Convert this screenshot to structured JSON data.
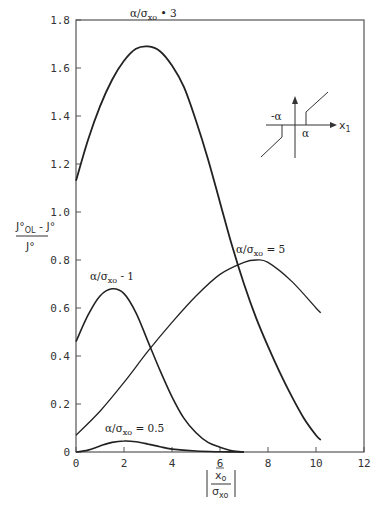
{
  "chart_data": {
    "type": "line",
    "title": "",
    "xlabel": "|x̄o / σxo|",
    "ylabel": "(J°OL − J°) / J°",
    "xlim": [
      0,
      12
    ],
    "ylim": [
      0,
      1.8
    ],
    "grid": false,
    "legend_position": "inline labels",
    "x_ticks": [
      "0",
      "2",
      "4",
      "6",
      "8",
      "10",
      "12"
    ],
    "y_ticks": [
      "0",
      "0.2",
      "0.4",
      "0.6",
      "0.8",
      "1.0",
      "1.2",
      "1.4",
      "1.6",
      "1.8"
    ],
    "series": [
      {
        "name": "α/σxo = 3",
        "x": [
          0,
          0.5,
          1,
          1.5,
          2,
          2.5,
          3,
          3.5,
          4,
          4.5,
          5,
          5.5,
          6,
          6.5,
          7,
          7.5,
          8,
          8.5,
          9,
          9.5,
          10,
          10.2
        ],
        "values": [
          1.13,
          1.3,
          1.44,
          1.55,
          1.63,
          1.68,
          1.69,
          1.67,
          1.61,
          1.52,
          1.38,
          1.22,
          1.04,
          0.86,
          0.7,
          0.56,
          0.44,
          0.33,
          0.23,
          0.14,
          0.07,
          0.05
        ]
      },
      {
        "name": "α/σxo = 5",
        "x": [
          0,
          1,
          2,
          3,
          4,
          5,
          6,
          7,
          7.5,
          8,
          9,
          10,
          10.2
        ],
        "values": [
          0.07,
          0.17,
          0.29,
          0.42,
          0.54,
          0.65,
          0.74,
          0.79,
          0.8,
          0.79,
          0.71,
          0.6,
          0.58
        ]
      },
      {
        "name": "α/σxo = 1",
        "x": [
          0,
          0.5,
          1,
          1.5,
          2,
          2.5,
          3,
          3.5,
          4,
          4.5,
          5,
          5.5,
          6,
          6.5,
          7
        ],
        "values": [
          0.46,
          0.57,
          0.65,
          0.68,
          0.66,
          0.58,
          0.46,
          0.34,
          0.23,
          0.14,
          0.08,
          0.04,
          0.02,
          0.005,
          0
        ]
      },
      {
        "name": "α/σxo = 0.5",
        "x": [
          0,
          0.5,
          1,
          1.5,
          2,
          2.5,
          3,
          3.5,
          4,
          5,
          6,
          7
        ],
        "values": [
          0,
          0.008,
          0.025,
          0.04,
          0.046,
          0.043,
          0.033,
          0.022,
          0.012,
          0.004,
          0.001,
          0
        ]
      }
    ],
    "annotations": [
      {
        "text": "α/σxo = 3",
        "x": 2.9,
        "y": 1.76
      },
      {
        "text": "α/σxo = 1",
        "x": 1.5,
        "y": 0.73
      },
      {
        "text": "α/σxo = 5",
        "x": 7.3,
        "y": 0.85
      },
      {
        "text": "α/σxo = 0.5",
        "x": 2.2,
        "y": 0.08
      }
    ],
    "inset": {
      "description": "dead-zone nonlinearity sketch",
      "labels": [
        "-α",
        "α",
        "x1"
      ]
    }
  },
  "labels": {
    "curve3_main": "α/σ",
    "curve3_sub": "xo",
    "curve3_val": " • 3",
    "curve1_main": "α/σ",
    "curve1_sub": "xo",
    "curve1_val": " - 1",
    "curve5_main": "α/σ",
    "curve5_sub": "xo",
    "curve5_val": " = 5",
    "curve05_main": "α/σ",
    "curve05_sub": "xo",
    "curve05_val": " = 0.5",
    "ylabel_num_main": "J°",
    "ylabel_num_sub": "OL",
    "ylabel_num_rest": " - J°",
    "ylabel_den": "J°",
    "xlabel_num_main": "x̄",
    "xlabel_num_sub": "o",
    "xlabel_den_main": "σ",
    "xlabel_den_sub": "xo",
    "inset_neg_alpha": "-α",
    "inset_alpha": "α",
    "inset_x_main": "x",
    "inset_x_sub": "1"
  }
}
